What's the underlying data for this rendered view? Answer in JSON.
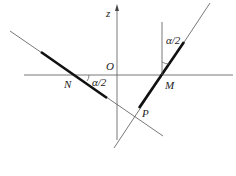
{
  "diagram": {
    "labels": {
      "z_axis": "z",
      "origin": "O",
      "point_n": "N",
      "point_m": "M",
      "point_p": "P",
      "angle_n": "α/2",
      "angle_m": "α/2"
    },
    "colors": {
      "line": "#444444",
      "thick": "#111111"
    }
  }
}
